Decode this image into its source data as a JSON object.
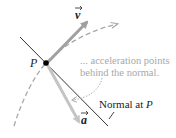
{
  "diagram": {
    "point_label": "P",
    "velocity_label": "v",
    "acceleration_label": "a",
    "annotation_line1": "... acceleration points",
    "annotation_line2": "behind the normal.",
    "normal_label_prefix": "Normal at ",
    "normal_label_point": "P",
    "colors": {
      "velocity": "#a0a0a0",
      "acceleration": "#c4c4c4",
      "path": "#a8a8a8",
      "normal": "#333333",
      "point": "#000000",
      "annotation": "#a8a8a8"
    }
  }
}
